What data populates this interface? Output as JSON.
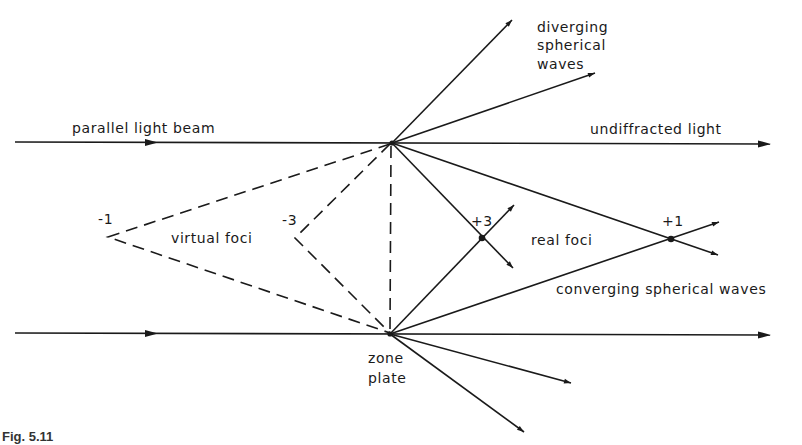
{
  "labels": {
    "parallel_beam": "parallel light beam",
    "undiffracted": "undiffracted light",
    "diverging_1": "diverging",
    "diverging_2": "spherical",
    "diverging_3": "waves",
    "virtual_foci": "virtual foci",
    "real_foci": "real foci",
    "converging": "converging  spherical waves",
    "zone_1": "zone",
    "zone_2": "plate",
    "minus1": "-1",
    "minus3": "-3",
    "plus3": "+3",
    "plus1": "+1"
  },
  "caption": "Fig. 5.11"
}
